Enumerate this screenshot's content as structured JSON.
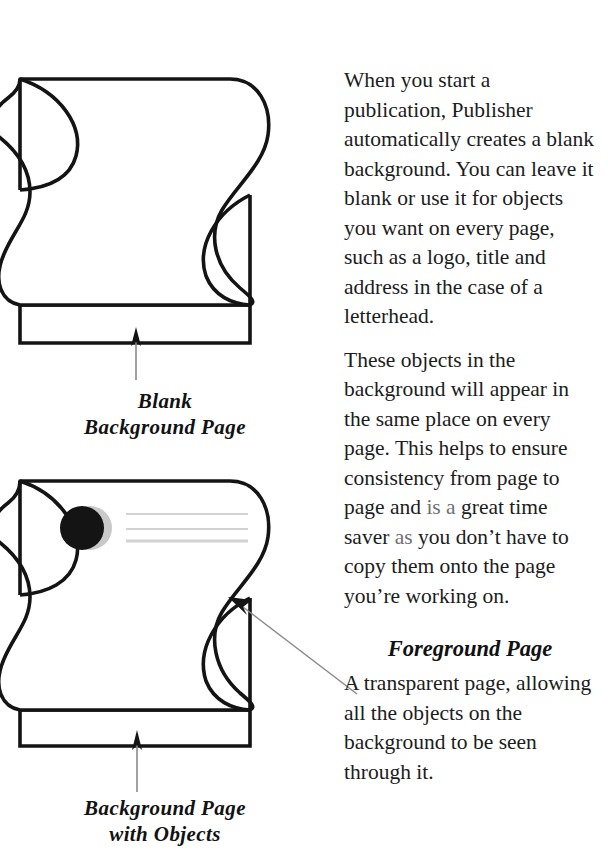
{
  "figures": [
    {
      "id": "blank-background-page",
      "name": "blank-background-page-diagram",
      "caption_lines": [
        "Blank",
        "Background Page"
      ],
      "objects": [],
      "arrow": "up-arrow-to-background-band"
    },
    {
      "id": "background-page-with-objects",
      "name": "background-page-with-objects-diagram",
      "caption_lines": [
        "Background Page",
        "with Objects"
      ],
      "objects": [
        "black-circle-logo",
        "text-line-1",
        "text-line-2",
        "text-line-3"
      ],
      "arrow": "up-arrow-to-background-band"
    }
  ],
  "callout": {
    "name": "foreground-page-leader-arrow",
    "points_to": "foreground-page-surface"
  },
  "text": {
    "paragraph_1": "When you start a publication, Publisher automatically creates a blank background. You can leave it blank or use it for objects you want on every page, such as a logo, title and address in the case of a letterhead.",
    "paragraph_2_part_1": "These objects in the background will appear in the same place on every page. This helps to ensure consistency from page to page and ",
    "paragraph_2_faded_1": "is a",
    "paragraph_2_part_2": " great time saver ",
    "paragraph_2_faded_2": "as",
    "paragraph_2_part_3": " you don’t have to copy them onto the page you’re working on.",
    "heading": "Foreground Page",
    "paragraph_3": "A transparent page, allowing all the objects on the background to be seen through it."
  },
  "colors": {
    "ink": "#1a1a1a",
    "outline": "#141414",
    "logo_fill": "#141414",
    "logo_shadow": "#c9c9c9",
    "text_line": "#d2d2d2",
    "leader_line": "#8a8a8a",
    "page_fill": "#ffffff"
  }
}
